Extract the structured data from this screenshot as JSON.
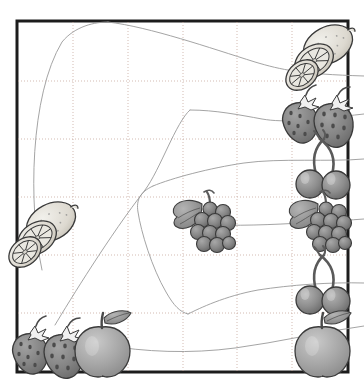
{
  "canvas": {
    "width": 364,
    "height": 387,
    "background": "#ffffff",
    "title": "fruit matching puzzle worksheet"
  },
  "frame": {
    "name": "puzzle-frame",
    "x": 17,
    "y": 21,
    "width": 331,
    "height": 351,
    "stroke": "#1c1c1c",
    "stroke_width": 3,
    "fill": "#ffffff"
  },
  "grid": {
    "stroke": "#c8a9a0",
    "stroke_width": 0.8,
    "dash": "1,2",
    "columns_x": [
      73,
      128,
      183,
      237,
      292
    ],
    "rows_y": [
      81,
      139,
      197,
      255,
      313
    ]
  },
  "connectors": {
    "stroke": "#9a9a9a",
    "stroke_width": 0.9,
    "paths": [
      {
        "name": "connector-lemon-left-to-top",
        "d": "M 42 270 C 28 205 30 95 62 42 C 75 26 95 22 108 22"
      },
      {
        "name": "connector-top-to-lemon-right",
        "d": "M 108 22 C 150 27 210 48 255 62 C 282 70 300 74 364 76"
      },
      {
        "name": "connector-strawberry-left-to-mid",
        "d": "M 55 325 C 70 300 110 235 145 190 C 160 170 176 122 190 110"
      },
      {
        "name": "connector-mid-to-strawberry-right",
        "d": "M 190 110 C 215 110 240 115 262 119 C 285 123 310 120 364 114"
      },
      {
        "name": "connector-cherry-upper-loop",
        "d": "M 364 159 C 330 162 280 158 244 163 C 210 168 172 178 153 186"
      },
      {
        "name": "connector-cherry-upper-loop-tail",
        "d": "M 153 186 C 140 192 136 200 138 212 C 141 232 152 268 166 292 C 174 306 180 312 188 314"
      },
      {
        "name": "connector-grapes-mid-to-right",
        "d": "M 214 225 C 250 226 285 224 318 222 C 336 221 350 220 364 219"
      },
      {
        "name": "connector-cherry-lower-to-left",
        "d": "M 364 283 C 330 282 290 285 258 290 C 225 296 200 308 188 314"
      },
      {
        "name": "connector-apple-left-to-right",
        "d": "M 104 345 C 145 352 190 354 235 348 C 280 342 320 332 364 326"
      }
    ]
  },
  "fruits": [
    {
      "name": "fruit-lemon-left",
      "kind": "lemon",
      "cx": 45,
      "cy": 232,
      "scale": 1.0
    },
    {
      "name": "fruit-strawberry-left",
      "kind": "strawberry",
      "cx": 52,
      "cy": 344,
      "scale": 1.0
    },
    {
      "name": "fruit-apple-left",
      "kind": "apple",
      "cx": 102,
      "cy": 344,
      "scale": 1.0
    },
    {
      "name": "fruit-grapes-middle",
      "kind": "grapes",
      "cx": 206,
      "cy": 228,
      "scale": 1.0
    },
    {
      "name": "fruit-lemon-right",
      "kind": "lemon",
      "cx": 322,
      "cy": 55,
      "scale": 1.0
    },
    {
      "name": "fruit-strawberry-right",
      "kind": "strawberry",
      "cx": 322,
      "cy": 113,
      "scale": 1.0
    },
    {
      "name": "fruit-cherries-right-1",
      "kind": "cherries",
      "cx": 322,
      "cy": 172,
      "scale": 1.0
    },
    {
      "name": "fruit-grapes-right",
      "kind": "grapes",
      "cx": 322,
      "cy": 228,
      "scale": 1.0
    },
    {
      "name": "fruit-cherries-right-2",
      "kind": "cherries",
      "cx": 322,
      "cy": 288,
      "scale": 1.0
    },
    {
      "name": "fruit-apple-right",
      "kind": "apple",
      "cx": 322,
      "cy": 344,
      "scale": 1.0
    }
  ],
  "palette": {
    "ink": "#2b2b2b",
    "lemon_body": "#d8d6cf",
    "lemon_light": "#eeece6",
    "strawberry": "#8b8b8b",
    "strawberry_dark": "#6e6e6e",
    "cherry": "#8f8f8f",
    "cherry_dark": "#6a6a6a",
    "grape": "#8a8a8a",
    "grape_dark": "#6d6d6d",
    "apple": "#a9a9a9",
    "apple_dark": "#8a8a8a",
    "leaf": "#9a9a9a",
    "stem": "#7a7a7a"
  }
}
